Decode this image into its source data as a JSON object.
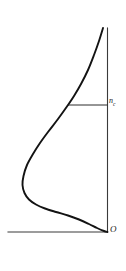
{
  "figure": {
    "background_color": "#ffffff",
    "curve_color": "#131313",
    "axis_color": "#3a3a3a",
    "hatch_color": "#4a4a4a",
    "labels": {
      "threshold_symbol": "n",
      "threshold_subscript": "c",
      "origin": "O"
    }
  },
  "chart_data": {
    "type": "line",
    "title": "",
    "subtitle": "",
    "xlabel": "",
    "ylabel": "",
    "grid": false,
    "legend": null,
    "orientation": "vertical-axis-right",
    "axis_ranges": {
      "x": [
        0,
        126
      ],
      "y": [
        0,
        271
      ]
    },
    "axes": [
      {
        "name": "vertical-axis",
        "x1": 107.5,
        "y1": 28,
        "x2": 107.5,
        "y2": 232
      },
      {
        "name": "horizontal-axis",
        "x1": 8,
        "y1": 232,
        "x2": 107.5,
        "y2": 232
      }
    ],
    "tick_labels": [
      "n_c",
      "O"
    ],
    "annotations": [
      {
        "name": "threshold-level",
        "text": "n_c",
        "x": 109,
        "y": 105,
        "description": "horizontal cut line bounding the hatched region from below"
      },
      {
        "name": "origin",
        "text": "O",
        "x": 110,
        "y": 232,
        "description": "origin at intersection of the two axes"
      }
    ],
    "cut_line": {
      "name": "threshold-cut-line",
      "x_start": 68,
      "x_end": 107.5,
      "y": 105
    },
    "hatched_region": {
      "name": "tail-region",
      "hatch_angle_deg": 45,
      "hatch_spacing_px": 5,
      "description": "region between the curve and the vertical axis above the n_c level"
    },
    "curve": {
      "name": "distribution-curve",
      "description": "S-shaped curve starting at the top near the vertical axis, bulging left to a maximum displacement, then returning to the origin at bottom right",
      "points": [
        [
          103.0,
          28.0
        ],
        [
          99.0,
          41.0
        ],
        [
          94.0,
          55.0
        ],
        [
          88.0,
          70.0
        ],
        [
          81.0,
          84.0
        ],
        [
          74.0,
          96.0
        ],
        [
          68.0,
          105.0
        ],
        [
          58.0,
          119.0
        ],
        [
          48.0,
          132.0
        ],
        [
          40.0,
          143.0
        ],
        [
          33.0,
          154.0
        ],
        [
          27.0,
          165.0
        ],
        [
          23.5,
          176.0
        ],
        [
          22.5,
          185.0
        ],
        [
          24.5,
          193.0
        ],
        [
          29.0,
          199.5
        ],
        [
          36.0,
          204.5
        ],
        [
          45.0,
          208.5
        ],
        [
          56.0,
          212.0
        ],
        [
          68.0,
          215.5
        ],
        [
          79.0,
          219.5
        ],
        [
          89.0,
          224.0
        ],
        [
          97.0,
          228.0
        ],
        [
          104.0,
          231.0
        ],
        [
          107.5,
          232.0
        ]
      ],
      "leftmost_point": [
        22.5,
        185.0
      ],
      "start_point": [
        103.0,
        28.0
      ],
      "end_point": [
        107.5,
        232.0
      ]
    }
  }
}
